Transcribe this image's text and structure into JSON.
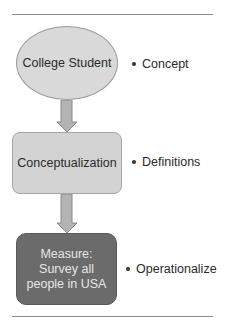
{
  "diagram": {
    "nodes": [
      {
        "id": "concept-node",
        "shape": "ellipse",
        "text": "College Student",
        "fill": "#d9d9d9"
      },
      {
        "id": "conceptualization-node",
        "shape": "rounded-rect",
        "text": "Conceptualization",
        "fill": "#d3d3d3"
      },
      {
        "id": "measure-node",
        "shape": "rounded-rect",
        "text": "Measure:\nSurvey all\npeople in USA",
        "fill": "#6b6b6b"
      }
    ],
    "edges": [
      {
        "from": "concept-node",
        "to": "conceptualization-node",
        "type": "block-arrow-down"
      },
      {
        "from": "conceptualization-node",
        "to": "measure-node",
        "type": "block-arrow-down"
      }
    ],
    "labels": [
      {
        "bullet": "•",
        "text": "Concept"
      },
      {
        "bullet": "•",
        "text": "Definitions"
      },
      {
        "bullet": "•",
        "text": "Operationalize"
      }
    ],
    "colors": {
      "rule": "#8c8c8c",
      "arrow_fill": "#b3b3b3",
      "arrow_stroke": "#8a8a8a",
      "dark_text": "#e6e6e6"
    }
  }
}
